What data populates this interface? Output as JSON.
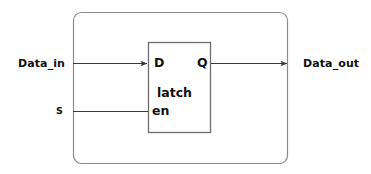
{
  "diagram": {
    "background_color": "#ffffff",
    "outer_block": {
      "name": "top-level-module",
      "stroke_color": "#8a8a8a",
      "corner_radius": 8
    },
    "inner_block": {
      "name": "latch-block",
      "label": "latch",
      "stroke_color": "#6e6e6e",
      "ports": {
        "data_input": "D",
        "data_output": "Q",
        "enable_input": "en"
      }
    },
    "signals": [
      {
        "name": "Data_in",
        "label": "Data_in",
        "direction": "input",
        "connects_to": "D",
        "arrowhead": true
      },
      {
        "name": "S",
        "label": "S",
        "direction": "input",
        "connects_to": "en",
        "arrowhead": false
      },
      {
        "name": "Data_out",
        "label": "Data_out",
        "direction": "output",
        "connects_to": "Q",
        "arrowhead": true
      }
    ],
    "wire_color": "#3a3a3a"
  }
}
